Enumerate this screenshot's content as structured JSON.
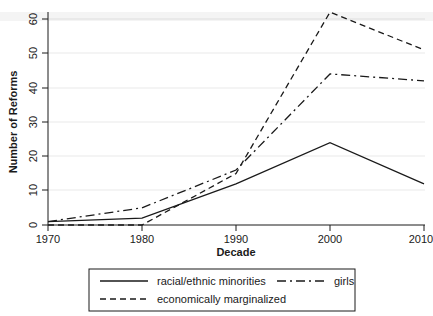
{
  "chart_data": {
    "type": "line",
    "title": "",
    "xlabel": "Decade",
    "ylabel": "Number of Reforms",
    "x": [
      1970,
      1980,
      1990,
      2000,
      2010
    ],
    "xticklabels": [
      "1970",
      "1980",
      "1990",
      "2000",
      "2010"
    ],
    "yticklabels": [
      "0",
      "10",
      "20",
      "30",
      "40",
      "50",
      "60"
    ],
    "yticks": [
      0,
      10,
      20,
      30,
      40,
      50,
      60
    ],
    "xlim": [
      1970,
      2010
    ],
    "ylim": [
      0,
      62
    ],
    "grid": false,
    "legend_position": "below-axes",
    "series": [
      {
        "name": "racial/ethnic minorities",
        "style": "solid",
        "values": [
          1,
          2,
          12,
          24,
          12
        ]
      },
      {
        "name": "girls",
        "style": "dash-dot",
        "values": [
          1,
          5,
          16,
          44,
          42
        ]
      },
      {
        "name": "economically marginalized",
        "style": "dashed",
        "values": [
          0,
          0,
          15,
          62,
          51
        ]
      }
    ]
  },
  "legend": {
    "entries": [
      {
        "label": "racial/ethnic minorities",
        "style": "solid"
      },
      {
        "label": "girls",
        "style": "dash-dot"
      },
      {
        "label": "economically marginalized",
        "style": "dashed"
      }
    ]
  }
}
